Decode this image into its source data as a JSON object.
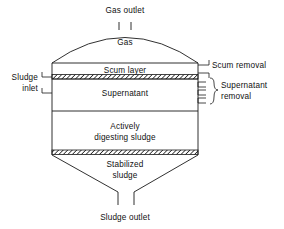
{
  "diagram": {
    "type": "cross-section schematic",
    "stroke_color": "#1a1a1a",
    "background_color": "#ffffff",
    "labels": {
      "gas_outlet": "Gas outlet",
      "gas": "Gas",
      "scum_layer": "Scum layer",
      "scum_removal": "Scum removal",
      "sludge_inlet_line1": "Sludge",
      "sludge_inlet_line2": "inlet",
      "supernatant": "Supernatant",
      "supernatant_removal_line1": "Supernatant",
      "supernatant_removal_line2": "removal",
      "actively_digesting_line1": "Actively",
      "actively_digesting_line2": "digesting sludge",
      "stabilized_line1": "Stabilized",
      "stabilized_line2": "sludge",
      "sludge_outlet": "Sludge outlet"
    },
    "zones": [
      {
        "name": "gas",
        "label": "Gas"
      },
      {
        "name": "scum-layer",
        "label": "Scum layer"
      },
      {
        "name": "supernatant",
        "label": "Supernatant"
      },
      {
        "name": "actively-digesting-sludge",
        "label": "Actively digesting sludge"
      },
      {
        "name": "stabilized-sludge",
        "label": "Stabilized sludge"
      }
    ],
    "ports": [
      {
        "name": "gas-outlet",
        "label": "Gas outlet",
        "side": "top"
      },
      {
        "name": "scum-removal",
        "label": "Scum removal",
        "side": "right"
      },
      {
        "name": "supernatant-removal",
        "label": "Supernatant removal",
        "side": "right",
        "stub_count": 3
      },
      {
        "name": "sludge-inlet",
        "label": "Sludge inlet",
        "side": "left",
        "stub_count": 2
      },
      {
        "name": "sludge-outlet",
        "label": "Sludge outlet",
        "side": "bottom"
      }
    ]
  }
}
